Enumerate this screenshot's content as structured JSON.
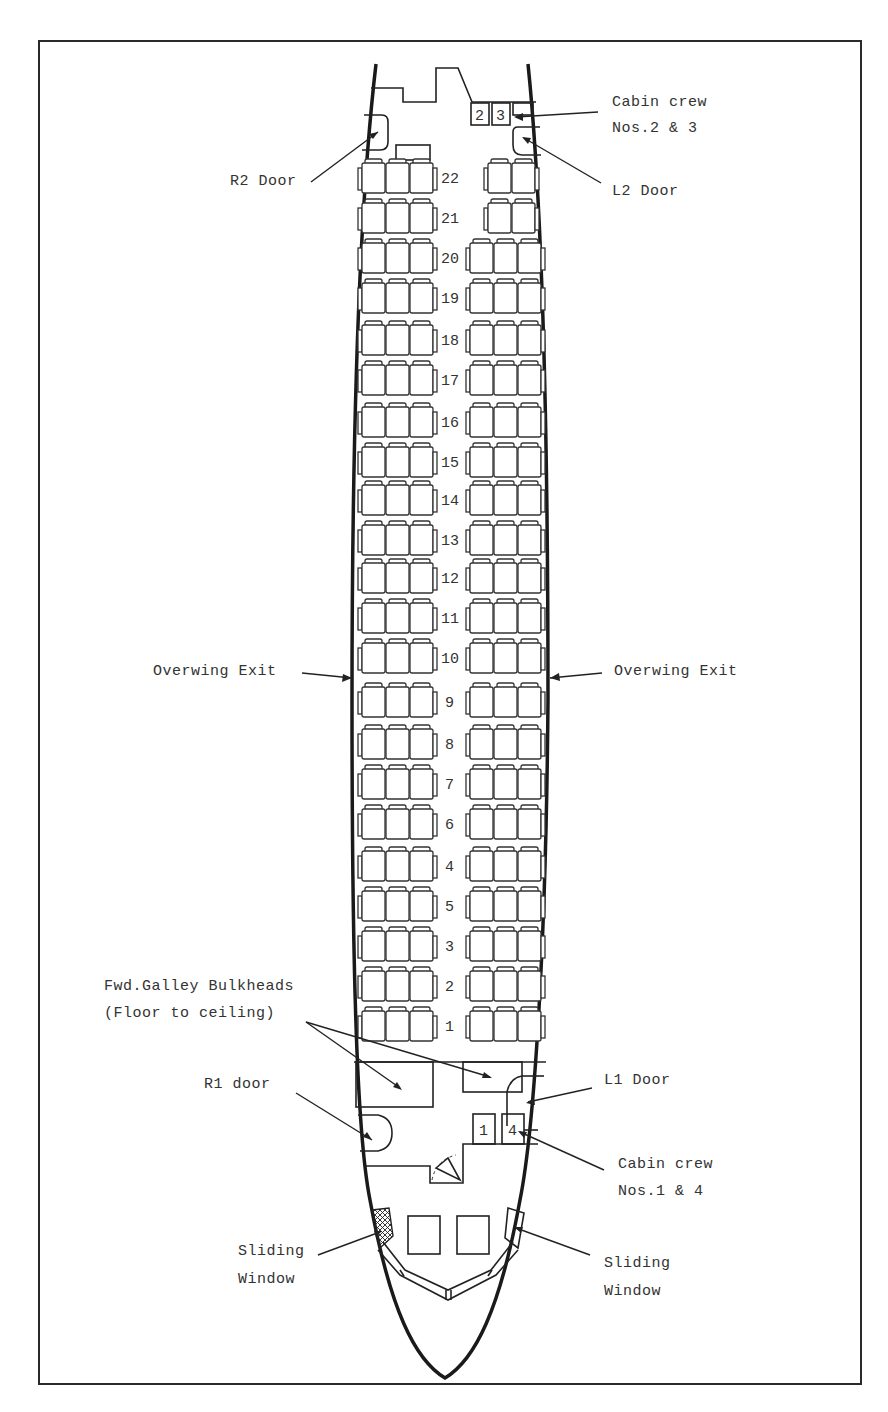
{
  "diagram": {
    "type": "aircraft-cabin-seating-plan",
    "labels": {
      "cabin_crew_23_line1": "Cabin crew",
      "cabin_crew_23_line2": "Nos.2 & 3",
      "r2_door": "R2 Door",
      "l2_door": "L2 Door",
      "overwing_exit_left": "Overwing Exit",
      "overwing_exit_right": "Overwing Exit",
      "fwd_galley_line1": "Fwd.Galley Bulkheads",
      "fwd_galley_line2": "(Floor to ceiling)",
      "r1_door": "R1 door",
      "l1_door": "L1 Door",
      "cabin_crew_14_line1": "Cabin crew",
      "cabin_crew_14_line2": "Nos.1 & 4",
      "sliding_window_left_line1": "Sliding",
      "sliding_window_left_line2": "Window",
      "sliding_window_right_line1": "Sliding",
      "sliding_window_right_line2": "Window"
    },
    "crew_seats": {
      "aft": [
        "2",
        "3"
      ],
      "fwd": [
        "1",
        "4"
      ]
    },
    "rows": [
      {
        "num": "22",
        "left": 3,
        "right": 2,
        "y": 178
      },
      {
        "num": "21",
        "left": 3,
        "right": 2,
        "y": 218
      },
      {
        "num": "20",
        "left": 3,
        "right": 3,
        "y": 258
      },
      {
        "num": "19",
        "left": 3,
        "right": 3,
        "y": 298
      },
      {
        "num": "18",
        "left": 3,
        "right": 3,
        "y": 340
      },
      {
        "num": "17",
        "left": 3,
        "right": 3,
        "y": 380
      },
      {
        "num": "16",
        "left": 3,
        "right": 3,
        "y": 422
      },
      {
        "num": "15",
        "left": 3,
        "right": 3,
        "y": 462
      },
      {
        "num": "14",
        "left": 3,
        "right": 3,
        "y": 500
      },
      {
        "num": "13",
        "left": 3,
        "right": 3,
        "y": 540
      },
      {
        "num": "12",
        "left": 3,
        "right": 3,
        "y": 578
      },
      {
        "num": "11",
        "left": 3,
        "right": 3,
        "y": 618
      },
      {
        "num": "10",
        "left": 3,
        "right": 3,
        "y": 658
      },
      {
        "num": "9",
        "left": 3,
        "right": 3,
        "y": 702
      },
      {
        "num": "8",
        "left": 3,
        "right": 3,
        "y": 744
      },
      {
        "num": "7",
        "left": 3,
        "right": 3,
        "y": 784
      },
      {
        "num": "6",
        "left": 3,
        "right": 3,
        "y": 824
      },
      {
        "num": "4",
        "left": 3,
        "right": 3,
        "y": 866
      },
      {
        "num": "5",
        "left": 3,
        "right": 3,
        "y": 906
      },
      {
        "num": "3",
        "left": 3,
        "right": 3,
        "y": 946
      },
      {
        "num": "2",
        "left": 3,
        "right": 3,
        "y": 986
      },
      {
        "num": "1",
        "left": 3,
        "right": 3,
        "y": 1026
      }
    ]
  }
}
